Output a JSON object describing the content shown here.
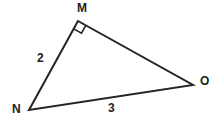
{
  "figure": {
    "type": "right-triangle-geometry-diagram",
    "background_color": "#ffffff",
    "stroke_color": "#252525",
    "stroke_width": 2,
    "vertices": [
      {
        "name": "M",
        "label": "M",
        "x": 78,
        "y": 21,
        "label_x": 77,
        "label_y": 2
      },
      {
        "name": "N",
        "label": "N",
        "x": 29,
        "y": 110,
        "label_x": 12,
        "label_y": 103
      },
      {
        "name": "O",
        "label": "O",
        "x": 193,
        "y": 85,
        "label_x": 200,
        "label_y": 75
      }
    ],
    "sides": [
      {
        "name": "MN",
        "from": "M",
        "to": "N",
        "label": "2",
        "label_x": 37,
        "label_y": 52
      },
      {
        "name": "NO",
        "from": "N",
        "to": "O",
        "label": "3",
        "label_x": 108,
        "label_y": 102
      },
      {
        "name": "MO",
        "from": "M",
        "to": "O",
        "label": "",
        "label_x": 0,
        "label_y": 0
      }
    ],
    "right_angle": {
      "at_vertex": "M",
      "marker": "square",
      "size": 9
    },
    "polygon_points": "78,21 29,110 193,85"
  }
}
